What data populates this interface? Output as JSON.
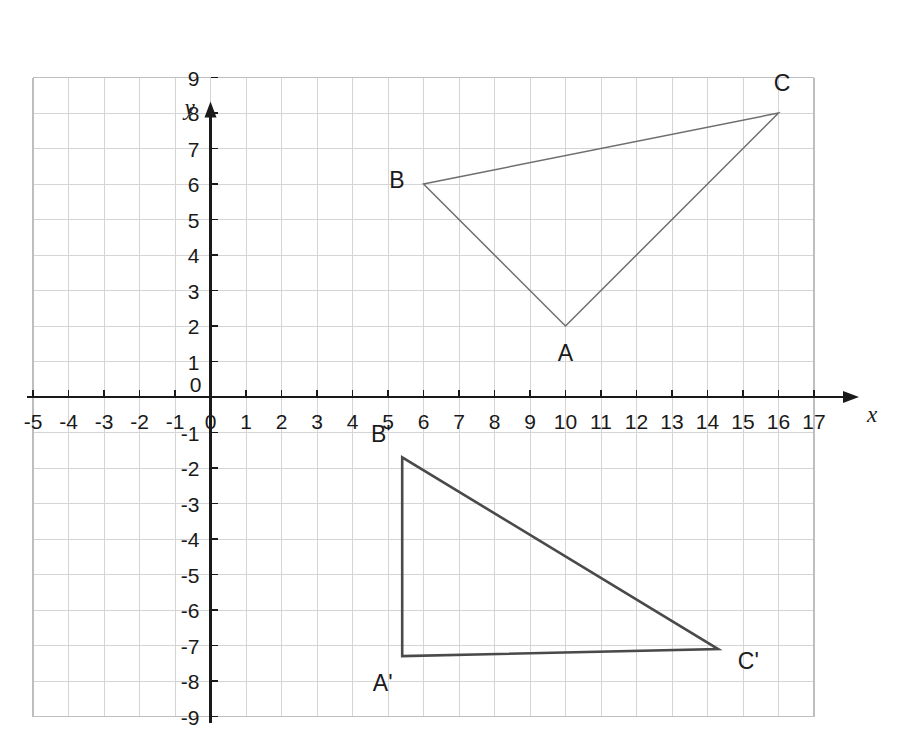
{
  "chart_data": {
    "type": "scatter",
    "title": "",
    "xlabel": "x",
    "ylabel": "y",
    "xlim": [
      -5,
      17
    ],
    "ylim": [
      -9,
      9
    ],
    "grid": true,
    "grid_step": 1,
    "legend": "none",
    "x_ticks": [
      "-5",
      "-4",
      "-3",
      "-2",
      "-1",
      "0",
      "1",
      "2",
      "3",
      "4",
      "5",
      "6",
      "7",
      "8",
      "9",
      "10",
      "11",
      "12",
      "13",
      "14",
      "15",
      "16",
      "17"
    ],
    "y_ticks": [
      "9",
      "8",
      "7",
      "6",
      "5",
      "4",
      "3",
      "2",
      "1",
      "0",
      "-1",
      "-2",
      "-3",
      "-4",
      "-5",
      "-6",
      "-7",
      "-8",
      "-9"
    ],
    "origin_label": "0",
    "shapes": [
      {
        "name": "triangle-abc",
        "style": "thin-gray",
        "color": "#6e6e6e",
        "stroke_width": 1.5,
        "closed": true,
        "vertices": [
          {
            "label": "A",
            "x": 10,
            "y": 2,
            "label_dx": 0.0,
            "label_dy": -0.75
          },
          {
            "label": "B",
            "x": 6,
            "y": 6,
            "label_dx": -0.75,
            "label_dy": 0.1
          },
          {
            "label": "C",
            "x": 16,
            "y": 8,
            "label_dx": 0.1,
            "label_dy": 0.85
          }
        ]
      },
      {
        "name": "triangle-a-prime-b-prime-c-prime",
        "style": "thick-dark",
        "color": "#4a4a4a",
        "stroke_width": 2.6,
        "closed": true,
        "vertices": [
          {
            "label": "A'",
            "x": 5.4,
            "y": -7.3,
            "label_dx": -0.55,
            "label_dy": -0.75
          },
          {
            "label": "B'",
            "x": 5.4,
            "y": -1.7,
            "label_dx": -0.6,
            "label_dy": 0.65
          },
          {
            "label": "C'",
            "x": 14.3,
            "y": -7.1,
            "label_dx": 0.85,
            "label_dy": -0.35
          }
        ]
      }
    ]
  },
  "colors": {
    "grid_minor": "#d5d5d8",
    "grid_major": "#bdbdc2",
    "axis": "#1a1a1a",
    "text": "#1a1a1a",
    "triangle_original": "#6e6e6e",
    "triangle_image": "#4a4a4a",
    "background": "#ffffff"
  }
}
